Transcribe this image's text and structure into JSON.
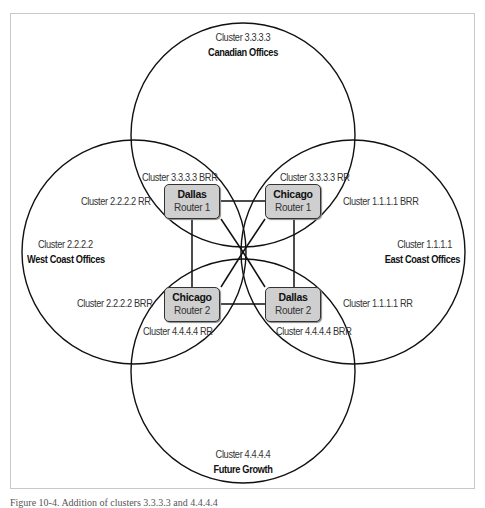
{
  "figure": {
    "caption": "Figure 10-4. Addition of clusters 3.3.3.3 and 4.4.4.4",
    "stroke_color": "#111111",
    "router_fill": "#cfcfcf"
  },
  "clusters": {
    "top": {
      "id": "Cluster 3.3.3.3",
      "name": "Canadian Offices"
    },
    "left": {
      "id": "Cluster 2.2.2.2",
      "name": "West Coast Offices"
    },
    "right": {
      "id": "Cluster 1.1.1.1",
      "name": "East Coast Offices"
    },
    "bottom": {
      "id": "Cluster 4.4.4.4",
      "name": "Future Growth"
    }
  },
  "routers": {
    "dallas_r1": {
      "name": "Dallas",
      "role": "Router 1"
    },
    "chicago_r1": {
      "name": "Chicago",
      "role": "Router 1"
    },
    "chicago_r2": {
      "name": "Chicago",
      "role": "Router 2"
    },
    "dallas_r2": {
      "name": "Dallas",
      "role": "Router 2"
    }
  },
  "role_labels": {
    "c3_brr": "Cluster 3.3.3.3 BRR",
    "c3_rr": "Cluster 3.3.3.3 RR",
    "c2_rr": "Cluster 2.2.2.2 RR",
    "c1_brr": "Cluster 1.1.1.1 BRR",
    "c2_brr": "Cluster 2.2.2.2 BRR",
    "c1_rr": "Cluster 1.1.1.1 RR",
    "c4_rr": "Cluster 4.4.4.4 RR",
    "c4_brr": "Cluster 4.4.4.4 BRR"
  }
}
